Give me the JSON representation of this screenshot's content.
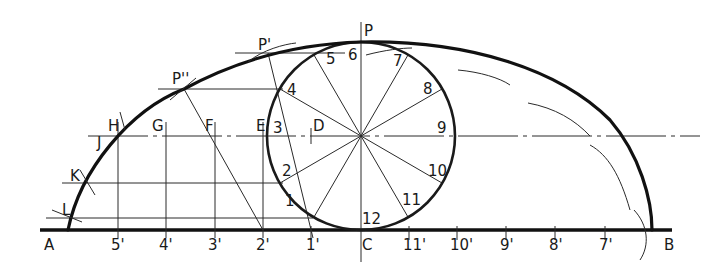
{
  "diagram": {
    "type": "cycloid-construction",
    "geometry": {
      "baseline_y": 230,
      "center": {
        "x": 361,
        "y": 136
      },
      "radius": 94,
      "baseline_x_start": 40,
      "baseline_x_end": 672
    },
    "top_labels": {
      "P": "P",
      "P1": "P'",
      "P2": "P''"
    },
    "circle_point_labels": [
      "1",
      "2",
      "3",
      "4",
      "5",
      "6",
      "7",
      "8",
      "9",
      "10",
      "11",
      "12"
    ],
    "side_labels": {
      "D": "D",
      "E": "E",
      "F": "F",
      "G": "G",
      "H": "H",
      "J": "J",
      "K": "K",
      "L": "L"
    },
    "baseline_labels": [
      {
        "text": "A",
        "x": 50
      },
      {
        "text": "5'",
        "x": 118
      },
      {
        "text": "4'",
        "x": 166
      },
      {
        "text": "3'",
        "x": 215
      },
      {
        "text": "2'",
        "x": 263
      },
      {
        "text": "1'",
        "x": 311
      },
      {
        "text": "C",
        "x": 361
      },
      {
        "text": "11'",
        "x": 409
      },
      {
        "text": "10'",
        "x": 457
      },
      {
        "text": "9'",
        "x": 506
      },
      {
        "text": "8'",
        "x": 555
      },
      {
        "text": "7'",
        "x": 605
      },
      {
        "text": "B",
        "x": 668
      }
    ]
  }
}
